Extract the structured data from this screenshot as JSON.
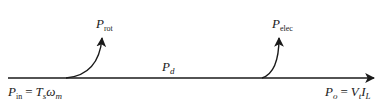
{
  "diagram": {
    "type": "power-flow",
    "colors": {
      "stroke": "#1a1a1a",
      "background": "#ffffff"
    },
    "main_flow": {
      "input": {
        "symbol": "P",
        "sub": "in",
        "eq": "=",
        "rhs_symbol": "T",
        "rhs_sub": "s",
        "rhs_symbol2": "ω",
        "rhs_sub2": "m"
      },
      "middle": {
        "symbol": "P",
        "sub": "d"
      },
      "output": {
        "symbol": "P",
        "sub": "o",
        "eq": "=",
        "rhs_symbol": "V",
        "rhs_sub": "t",
        "rhs_symbol2": "I",
        "rhs_sub2": "L"
      }
    },
    "losses": [
      {
        "symbol": "P",
        "sub": "rot"
      },
      {
        "symbol": "P",
        "sub": "elec"
      }
    ]
  }
}
